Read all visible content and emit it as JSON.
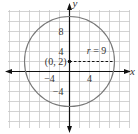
{
  "diagram": {
    "type": "circle-on-coordinate-grid",
    "x_axis_label": "x",
    "y_axis_label": "y",
    "x_ticks": [
      {
        "value": -4,
        "label": "−4"
      },
      {
        "value": 4,
        "label": "4"
      }
    ],
    "y_ticks": [
      {
        "value": 8,
        "label": "8"
      },
      {
        "value": 4,
        "label": "4"
      },
      {
        "value": -4,
        "label": "−4"
      }
    ],
    "grid_step": 2,
    "x_range": [
      -12,
      12
    ],
    "y_range": [
      -11,
      12
    ],
    "circle": {
      "center": [
        0,
        2
      ],
      "radius": 9,
      "center_label": "(0, 2)",
      "radius_label": "r = 9"
    },
    "colors": {
      "grid": "#c8c8c8",
      "axis": "#111111",
      "circle": "#777777"
    }
  }
}
